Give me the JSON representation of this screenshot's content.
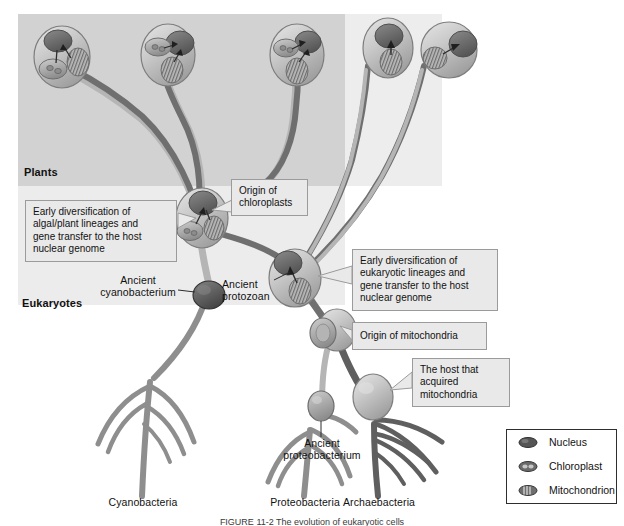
{
  "figure": {
    "caption": "FIGURE 11-2 The evolution of eukaryotic cells",
    "regions": {
      "plants_label": "Plants",
      "eukaryotes_label": "Eukaryotes"
    }
  },
  "callouts": [
    {
      "id": "origin-of-chloroplasts",
      "text": "Origin of\nchloroplasts"
    },
    {
      "id": "early-diversification-algal",
      "text": "Early diversification of\nalgal/plant lineages and\ngene transfer to the host\nnuclear genome"
    },
    {
      "id": "early-diversification-eukaryotic",
      "text": "Early diversification of\neukaryotic lineages and\ngene transfer to the host\nnuclear genome"
    },
    {
      "id": "origin-of-mitochondria",
      "text": "Origin of mitochondria"
    },
    {
      "id": "host-acquired-mitochondria",
      "text": "The host that\nacquired\nmitochondria"
    }
  ],
  "node_labels": [
    {
      "id": "ancient-cyanobacterium",
      "text": "Ancient\ncyanobacterium"
    },
    {
      "id": "ancient-protozoan",
      "text": "Ancient\nprotozoan"
    },
    {
      "id": "ancient-proteobacterium",
      "text": "Ancient\nproteobacterium"
    }
  ],
  "tip_labels": [
    {
      "id": "cyanobacteria",
      "text": "Cyanobacteria"
    },
    {
      "id": "proteobacteria",
      "text": "Proteobacteria"
    },
    {
      "id": "archaebacteria",
      "text": "Archaebacteria"
    }
  ],
  "legend": {
    "items": [
      {
        "id": "nucleus",
        "label": "Nucleus",
        "icon": "nucleus-icon",
        "color": "#4f4f4f"
      },
      {
        "id": "chloroplast",
        "label": "Chloroplast",
        "icon": "chloroplast-icon",
        "color": "#6b6b6b"
      },
      {
        "id": "mitochondrion",
        "label": "Mitochondrion",
        "icon": "mitochondrion-icon",
        "color": "#7a7a7a"
      }
    ]
  },
  "colors": {
    "plants_panel": "#d2d2d2",
    "eukaryotes_panel": "#ededed",
    "lineage_dark": "#6f6f6f",
    "lineage_light": "#b5b5b5",
    "cell_body": "#c8c8c8",
    "nucleus": "#6a6a6a",
    "callout_bg": "#e9e9e9",
    "callout_border": "#9b9b9b"
  }
}
